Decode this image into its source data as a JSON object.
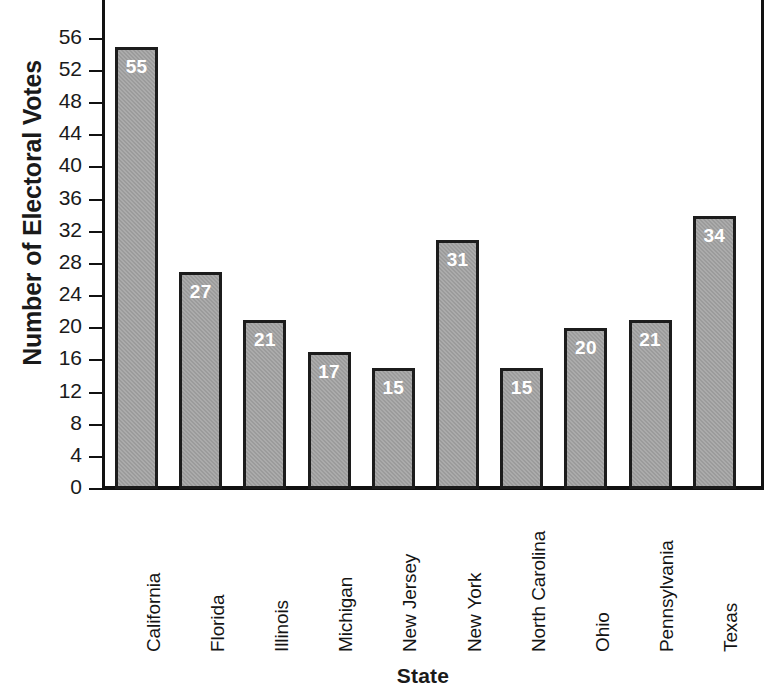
{
  "chart_data": {
    "type": "bar",
    "title": "",
    "xlabel": "State",
    "ylabel": "Number of Electoral Votes",
    "categories": [
      "California",
      "Florida",
      "Illinois",
      "Michigan",
      "New Jersey",
      "New York",
      "North Carolina",
      "Ohio",
      "Pennsylvania",
      "Texas"
    ],
    "values": [
      55,
      27,
      21,
      17,
      15,
      31,
      15,
      20,
      21,
      34
    ],
    "value_labels": [
      "55",
      "27",
      "21",
      "17",
      "15",
      "31",
      "15",
      "20",
      "21",
      "34"
    ],
    "ylim": [
      0,
      56
    ],
    "ytick_step": 4,
    "yticks": [
      0,
      4,
      8,
      12,
      16,
      20,
      24,
      28,
      32,
      36,
      40,
      44,
      48,
      52,
      56
    ],
    "ytick_labels": [
      "0",
      "4",
      "8",
      "12",
      "16",
      "20",
      "24",
      "28",
      "32",
      "36",
      "40",
      "44",
      "48",
      "52",
      "56"
    ],
    "grid": false,
    "legend": null,
    "bar_fill_color": "#9b9b9b",
    "bar_border_color": "#1c1c1c",
    "value_label_color": "#ffffff",
    "axis_color": "#111111",
    "background_color": "#ffffff",
    "category_label_rotation": -90
  }
}
